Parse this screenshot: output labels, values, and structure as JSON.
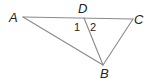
{
  "diagram": {
    "type": "geometry-triangle",
    "line_color": "#8a8a8a",
    "text_color": "#222222",
    "points": {
      "A": {
        "label": "A",
        "x": 23,
        "y": 17
      },
      "D": {
        "label": "D",
        "x": 84,
        "y": 18
      },
      "C": {
        "label": "C",
        "x": 133,
        "y": 19
      },
      "B": {
        "label": "B",
        "x": 103,
        "y": 65
      }
    },
    "segments": [
      [
        "A",
        "C"
      ],
      [
        "A",
        "B"
      ],
      [
        "D",
        "B"
      ],
      [
        "C",
        "B"
      ]
    ],
    "angles": {
      "angle1": {
        "label": "1"
      },
      "angle2": {
        "label": "2"
      }
    }
  }
}
